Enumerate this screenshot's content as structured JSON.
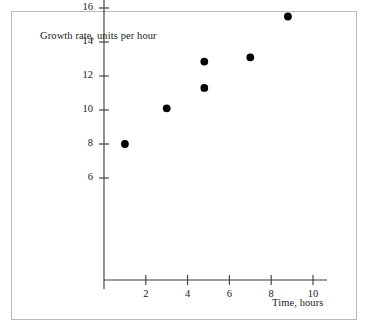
{
  "figure": {
    "background_color": "#ffffff",
    "frame_color": "#b9b9b9",
    "axis_color": "#3a3a3a",
    "point_color": "#000000"
  },
  "chart_data": {
    "type": "scatter",
    "title": "",
    "xlabel": "Time, hours",
    "ylabel": "Growth rate, units per hour",
    "xlim": [
      0,
      11
    ],
    "ylim": [
      0,
      17
    ],
    "grid": false,
    "legend": null,
    "xticks": [
      2,
      4,
      6,
      8,
      10
    ],
    "xtick_labels": [
      "2",
      "4",
      "6",
      "8",
      "10"
    ],
    "yticks": [
      6,
      8,
      10,
      12,
      14,
      16
    ],
    "ytick_labels": [
      "6",
      "8",
      "10",
      "12",
      "14",
      "16"
    ],
    "points": [
      {
        "x": 1.0,
        "y": 8.0
      },
      {
        "x": 3.0,
        "y": 10.1
      },
      {
        "x": 4.8,
        "y": 12.85
      },
      {
        "x": 4.8,
        "y": 11.3
      },
      {
        "x": 7.0,
        "y": 13.1
      },
      {
        "x": 8.8,
        "y": 15.5
      }
    ],
    "marker": "filled-circle",
    "marker_size": 5
  }
}
